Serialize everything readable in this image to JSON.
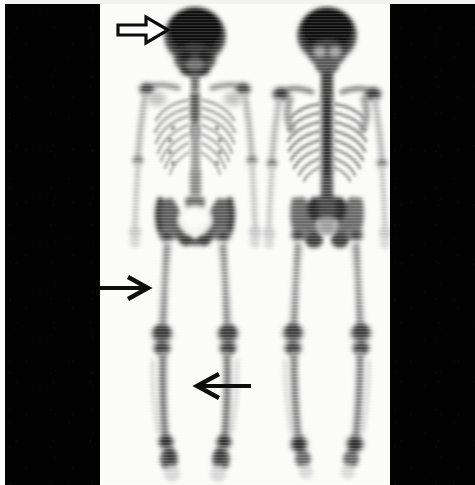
{
  "figure": {
    "modality": "bone-scintigraphy",
    "tracer": "Tc-99m MDP",
    "caption": "Whole-body bone scintigram, anterior and posterior views",
    "background_color": "#020202",
    "film_color": "#fbfbfa",
    "uptake_color": "#111111",
    "width_px": 475,
    "height_px": 485
  },
  "views": [
    {
      "id": "anterior",
      "label": "Anterior whole-body view",
      "center_x": 195,
      "regions": [
        {
          "name": "calvarium",
          "intensity": "markedly-increased"
        },
        {
          "name": "facial-skeleton",
          "intensity": "increased"
        },
        {
          "name": "mandible",
          "intensity": "increased"
        },
        {
          "name": "cervical-spine",
          "intensity": "moderate"
        },
        {
          "name": "shoulders",
          "intensity": "increased"
        },
        {
          "name": "sternum",
          "intensity": "moderate"
        },
        {
          "name": "ribs",
          "intensity": "mild"
        },
        {
          "name": "humeri",
          "intensity": "mild"
        },
        {
          "name": "forearms",
          "intensity": "mild"
        },
        {
          "name": "iliac-crests",
          "intensity": "increased"
        },
        {
          "name": "sacrum",
          "intensity": "increased"
        },
        {
          "name": "hip-joints",
          "intensity": "increased"
        },
        {
          "name": "bladder",
          "intensity": "photopenic"
        },
        {
          "name": "femora",
          "intensity": "mild"
        },
        {
          "name": "knees",
          "intensity": "markedly-increased"
        },
        {
          "name": "tibiae",
          "intensity": "increased"
        },
        {
          "name": "ankles",
          "intensity": "markedly-increased"
        },
        {
          "name": "feet",
          "intensity": "increased"
        }
      ]
    },
    {
      "id": "posterior",
      "label": "Posterior whole-body view",
      "center_x": 327,
      "regions": [
        {
          "name": "calvarium",
          "intensity": "markedly-increased"
        },
        {
          "name": "occiput",
          "intensity": "increased"
        },
        {
          "name": "cervical-spine",
          "intensity": "increased"
        },
        {
          "name": "thoracic-spine",
          "intensity": "markedly-increased"
        },
        {
          "name": "lumbar-spine",
          "intensity": "markedly-increased"
        },
        {
          "name": "scapulae",
          "intensity": "increased"
        },
        {
          "name": "ribs",
          "intensity": "moderate"
        },
        {
          "name": "humeri",
          "intensity": "mild"
        },
        {
          "name": "forearms",
          "intensity": "mild"
        },
        {
          "name": "sacroiliac-joints",
          "intensity": "markedly-increased"
        },
        {
          "name": "iliac-wings",
          "intensity": "increased"
        },
        {
          "name": "ischia",
          "intensity": "increased"
        },
        {
          "name": "femora",
          "intensity": "mild"
        },
        {
          "name": "knees",
          "intensity": "markedly-increased"
        },
        {
          "name": "tibiae",
          "intensity": "increased"
        },
        {
          "name": "ankles",
          "intensity": "markedly-increased"
        }
      ]
    }
  ],
  "annotations": [
    {
      "id": "arrow-skull",
      "style": "outlined",
      "direction": "right",
      "target": "calvarium",
      "tip_x": 168,
      "tip_y": 30,
      "tail_x": 118,
      "length": 50,
      "color": "#0d0d0d",
      "fill": "#ffffff"
    },
    {
      "id": "arrow-left-femur",
      "style": "solid",
      "direction": "right",
      "target": "left-distal-femur-shaft",
      "tip_x": 148,
      "tip_y": 287,
      "tail_x": 100,
      "length": 48,
      "color": "#0d0d0d",
      "fill": "#0d0d0d"
    },
    {
      "id": "arrow-right-tibia",
      "style": "solid",
      "direction": "left",
      "target": "right-tibial-shaft",
      "tip_x": 196,
      "tip_y": 385,
      "tail_x": 250,
      "length": 54,
      "color": "#0d0d0d",
      "fill": "#0d0d0d"
    }
  ]
}
